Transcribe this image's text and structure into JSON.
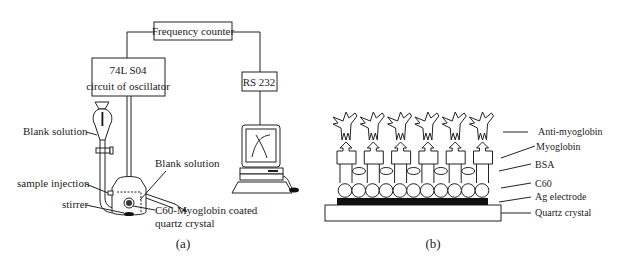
{
  "panel_a": {
    "caption": "(a)",
    "frequency_counter": "Frequency counter",
    "oscillator_line1": "74L S04",
    "oscillator_line2": "circuit of oscillator",
    "rs232": "RS 232",
    "labels": {
      "blank_solution_left": "Blank solution",
      "blank_solution_right": "Blank solution",
      "sample_injection": "sample injection",
      "stirrer": "stirrer",
      "crystal_line1": "C60-Myoglobin coated",
      "crystal_line2": "quartz crystal"
    }
  },
  "panel_b": {
    "caption": "(b)",
    "layers": [
      {
        "id": "anti-myoglobin",
        "label": "Anti-myoglobin"
      },
      {
        "id": "myoglobin",
        "label": "Myoglobin"
      },
      {
        "id": "bsa",
        "label": "BSA"
      },
      {
        "id": "c60",
        "label": "C60"
      },
      {
        "id": "ag-electrode",
        "label": "Ag electrode"
      },
      {
        "id": "quartz-crystal",
        "label": "Quartz crystal"
      }
    ],
    "antibody_count": 6,
    "myoglobin_count": 6,
    "bsa_count": 5,
    "c60_count": 11
  }
}
